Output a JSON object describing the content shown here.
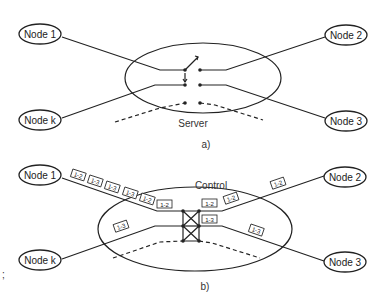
{
  "diagram_a": {
    "caption": "a)",
    "center_label": "Server",
    "nodes": [
      {
        "id": "node-1",
        "label": "Node 1"
      },
      {
        "id": "node-2",
        "label": "Node 2"
      },
      {
        "id": "node-k",
        "label": "Node k"
      },
      {
        "id": "node-3",
        "label": "Node 3"
      }
    ]
  },
  "diagram_b": {
    "caption": "b)",
    "center_label": "Control",
    "nodes": [
      {
        "id": "node-1",
        "label": "Node 1"
      },
      {
        "id": "node-2",
        "label": "Node 2"
      },
      {
        "id": "node-k",
        "label": "Node k"
      },
      {
        "id": "node-3",
        "label": "Node 3"
      }
    ],
    "packet_labels_node1_line": [
      "1-2",
      "1-3",
      "1-3",
      "1-3",
      "1-2",
      "1-2"
    ],
    "packet_label_nodek_line": "1-3",
    "packet_labels_out_top": [
      "1-2",
      "1-2",
      "1-2"
    ],
    "packet_labels_out_bottom": [
      "1-3",
      "1-3"
    ]
  },
  "side_mark": ";"
}
